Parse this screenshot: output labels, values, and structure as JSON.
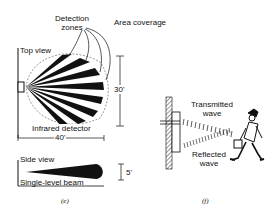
{
  "panel_e": {
    "title": "Area coverage",
    "detection_zones_label_1": "Detection",
    "detection_zones_label_2": "zones",
    "top_view_label": "Top view",
    "detector_label": "Infrared detector",
    "width_dim": "40'",
    "depth_dim": "30'",
    "side_view_label": "Side view",
    "beam_label": "Single-level beam",
    "height_dim": "5'",
    "caption": "(e)"
  },
  "panel_f": {
    "transmitted_1": "Transmitted",
    "transmitted_2": "wave",
    "reflected_1": "Reflected",
    "reflected_2": "wave",
    "caption": "(f)"
  },
  "colors": {
    "ink": "#111111",
    "background": "#ffffff"
  }
}
